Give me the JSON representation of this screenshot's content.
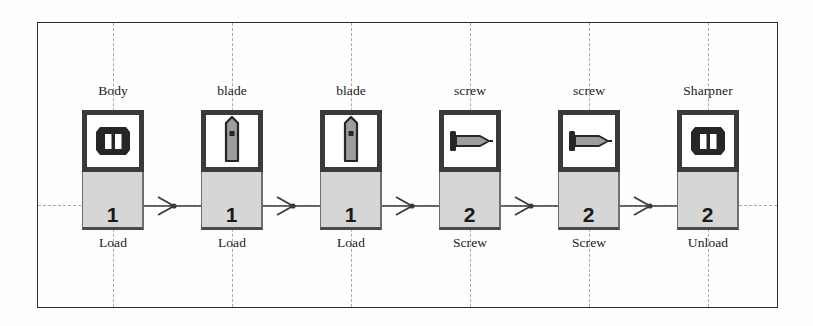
{
  "diagram": {
    "frame": {
      "border_color": "#2b2b2b"
    },
    "grid": {
      "line_color": "#a9a9a9",
      "style": "dashed"
    },
    "colors": {
      "node_border": "#3a3a3a",
      "count_fill": "#d6d6d6",
      "icon_fill": "#ffffff",
      "part_gray": "#9d9d9d",
      "part_dark": "#262626",
      "connector": "#3a3a3a"
    },
    "nodes": [
      {
        "id": "station-1",
        "part_label": "Body",
        "operation_label": "Load",
        "count": "1",
        "icon": "spool-body-icon",
        "x": 82
      },
      {
        "id": "station-2",
        "part_label": "blade",
        "operation_label": "Load",
        "count": "1",
        "icon": "blade-icon",
        "x": 201
      },
      {
        "id": "station-3",
        "part_label": "blade",
        "operation_label": "Load",
        "count": "1",
        "icon": "blade-icon",
        "x": 320
      },
      {
        "id": "station-4",
        "part_label": "screw",
        "operation_label": "Screw",
        "count": "2",
        "icon": "screw-icon",
        "x": 439
      },
      {
        "id": "station-5",
        "part_label": "screw",
        "operation_label": "Screw",
        "count": "2",
        "icon": "screw-icon",
        "x": 558
      },
      {
        "id": "station-6",
        "part_label": "Sharpner",
        "operation_label": "Unload",
        "count": "2",
        "icon": "spool-body-icon",
        "x": 677
      }
    ],
    "connectors": [
      {
        "id": "arrow-1-2",
        "from": "station-1",
        "to": "station-2"
      },
      {
        "id": "arrow-2-3",
        "from": "station-2",
        "to": "station-3"
      },
      {
        "id": "arrow-3-4",
        "from": "station-3",
        "to": "station-4"
      },
      {
        "id": "arrow-4-5",
        "from": "station-4",
        "to": "station-5"
      },
      {
        "id": "arrow-5-6",
        "from": "station-5",
        "to": "station-6"
      }
    ]
  }
}
